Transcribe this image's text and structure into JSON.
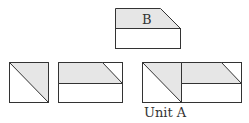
{
  "diagram": {
    "shape_b": {
      "label": "B"
    },
    "unit_a": {
      "label": "Unit A"
    },
    "colors": {
      "fill": "#e6e6e6",
      "stroke": "#333333",
      "background": "#ffffff"
    }
  }
}
